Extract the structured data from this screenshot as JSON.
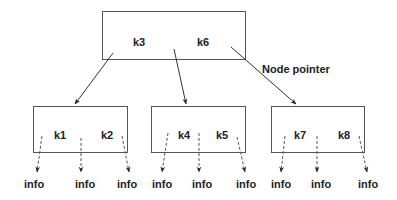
{
  "diagram": {
    "type": "b-plus-tree",
    "annotation": "Node pointer",
    "root": {
      "keys": [
        "k3",
        "k6"
      ]
    },
    "children": [
      {
        "keys": [
          "k1",
          "k2"
        ],
        "leaf_labels": [
          "info",
          "info",
          "info"
        ]
      },
      {
        "keys": [
          "k4",
          "k5"
        ],
        "leaf_labels": [
          "info",
          "info",
          "info"
        ]
      },
      {
        "keys": [
          "k7",
          "k8"
        ],
        "leaf_labels": [
          "info",
          "info",
          "info"
        ]
      }
    ],
    "colors": {
      "stroke": "#555555",
      "text": "#222222",
      "background": "#ffffff"
    }
  }
}
